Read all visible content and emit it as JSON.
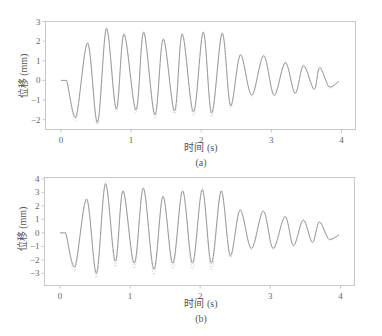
{
  "chart_data": [
    {
      "type": "line",
      "caption": "(a)",
      "title": "",
      "xlabel": "时间 (s)",
      "ylabel": "位移 (mm)",
      "xlim": [
        -0.22,
        4.2
      ],
      "ylim": [
        -2.5,
        3
      ],
      "xticks": [
        0,
        1,
        2,
        3,
        4
      ],
      "yticks": [
        -2,
        -1,
        0,
        1,
        2,
        3
      ],
      "grid": false,
      "legend": null,
      "series": [
        {
          "name": "solid",
          "style": "solid",
          "color": "#9a9a9a",
          "x": [
            0,
            0.08,
            0.21,
            0.38,
            0.52,
            0.65,
            0.79,
            0.9,
            1.07,
            1.18,
            1.34,
            1.46,
            1.62,
            1.73,
            1.89,
            2.03,
            2.15,
            2.3,
            2.42,
            2.56,
            2.72,
            2.89,
            3.04,
            3.2,
            3.34,
            3.46,
            3.61,
            3.69,
            3.83,
            3.96
          ],
          "y": [
            0,
            0,
            -1.9,
            1.9,
            -2.15,
            2.65,
            -1.45,
            2.35,
            -1.5,
            2.45,
            -1.75,
            2.1,
            -1.55,
            2.35,
            -1.6,
            2.45,
            -1.65,
            2.4,
            -1.3,
            1.3,
            -0.75,
            1.25,
            -0.75,
            0.9,
            -0.65,
            0.75,
            -0.45,
            0.65,
            -0.35,
            -0.05
          ]
        },
        {
          "name": "dotted",
          "style": "dotted",
          "color": "#c4c4c4",
          "x": [
            0,
            0.08,
            0.21,
            0.38,
            0.52,
            0.65,
            0.79,
            0.9,
            1.07,
            1.18,
            1.34,
            1.46,
            1.62,
            1.73,
            1.89,
            2.03,
            2.15,
            2.3,
            2.42,
            2.56,
            2.72,
            2.89,
            3.04,
            3.2,
            3.34,
            3.46,
            3.61,
            3.69,
            3.83,
            3.96
          ],
          "y": [
            0,
            0,
            -2.05,
            1.95,
            -2.3,
            2.7,
            -1.6,
            2.4,
            -1.65,
            2.5,
            -1.95,
            2.15,
            -1.75,
            2.4,
            -1.8,
            2.5,
            -1.85,
            2.45,
            -1.4,
            1.35,
            -0.8,
            1.3,
            -0.8,
            0.95,
            -0.7,
            0.8,
            -0.5,
            0.7,
            -0.4,
            -0.05
          ]
        }
      ]
    },
    {
      "type": "line",
      "caption": "(b)",
      "title": "",
      "xlabel": "时间 (s)",
      "ylabel": "位移 (mm)",
      "xlim": [
        -0.22,
        4.2
      ],
      "ylim": [
        -3.9,
        4.1
      ],
      "xticks": [
        0,
        1,
        2,
        3,
        4
      ],
      "yticks": [
        -3,
        -2,
        -1,
        0,
        1,
        2,
        3,
        4
      ],
      "grid": false,
      "legend": null,
      "series": [
        {
          "name": "solid",
          "style": "solid",
          "color": "#9a9a9a",
          "x": [
            0,
            0.08,
            0.21,
            0.38,
            0.52,
            0.65,
            0.79,
            0.9,
            1.06,
            1.19,
            1.34,
            1.47,
            1.61,
            1.75,
            1.89,
            2.03,
            2.16,
            2.3,
            2.43,
            2.57,
            2.73,
            2.9,
            3.04,
            3.21,
            3.33,
            3.47,
            3.6,
            3.7,
            3.84,
            3.98
          ],
          "y": [
            0,
            0,
            -2.55,
            2.5,
            -3.0,
            3.65,
            -2.1,
            3.1,
            -2.25,
            3.3,
            -2.7,
            2.7,
            -2.25,
            3.1,
            -2.25,
            3.2,
            -2.25,
            3.1,
            -1.7,
            1.7,
            -1.15,
            1.6,
            -1.15,
            1.2,
            -0.95,
            0.95,
            -0.7,
            0.8,
            -0.5,
            -0.15
          ]
        },
        {
          "name": "dotted",
          "style": "dotted",
          "color": "#c4c4c4",
          "x": [
            0,
            0.08,
            0.21,
            0.38,
            0.52,
            0.65,
            0.79,
            0.9,
            1.06,
            1.19,
            1.34,
            1.47,
            1.61,
            1.75,
            1.89,
            2.03,
            2.16,
            2.3,
            2.43,
            2.57,
            2.73,
            2.9,
            3.04,
            3.21,
            3.33,
            3.47,
            3.6,
            3.7,
            3.84,
            3.98
          ],
          "y": [
            0,
            0,
            -2.85,
            2.55,
            -3.3,
            3.7,
            -2.5,
            3.15,
            -2.6,
            3.35,
            -3.1,
            2.75,
            -2.65,
            3.15,
            -2.7,
            3.25,
            -2.75,
            3.15,
            -1.9,
            1.75,
            -1.25,
            1.65,
            -1.25,
            1.25,
            -1.0,
            1.0,
            -0.75,
            0.85,
            -0.55,
            -0.15
          ]
        }
      ]
    }
  ]
}
